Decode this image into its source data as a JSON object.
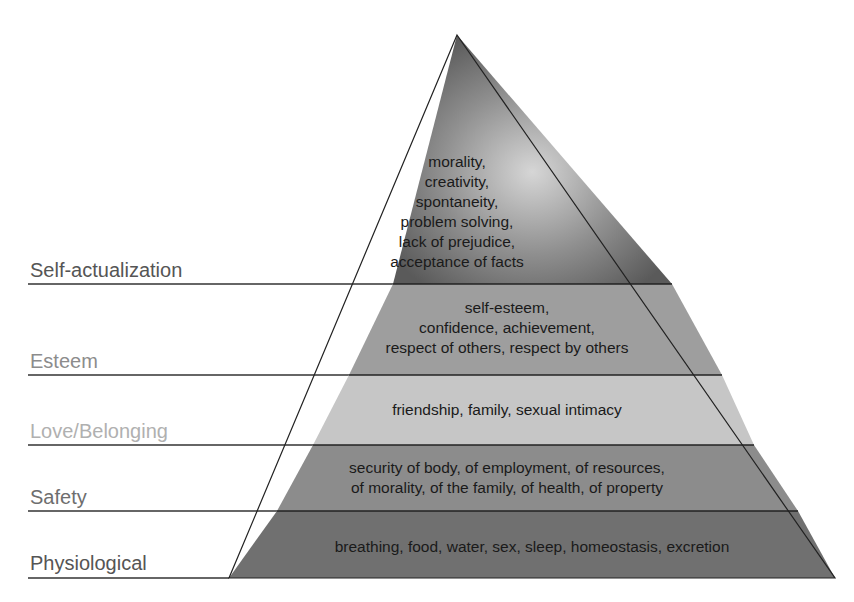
{
  "levels": [
    {
      "name": "Self-actualization",
      "label_color": "#555555",
      "fill_top": "#8a8a8a",
      "fill_bottom": "#5e5e5e",
      "lines": [
        "morality,",
        "creativity,",
        "spontaneity,",
        "problem solving,",
        "lack of prejudice,",
        "acceptance of facts"
      ]
    },
    {
      "name": "Esteem",
      "label_color": "#8c8c8c",
      "fill": "#9e9e9e",
      "lines": [
        "self-esteem,",
        "confidence, achievement,",
        "respect of others, respect by others"
      ]
    },
    {
      "name": "Love/Belonging",
      "label_color": "#b0b0b0",
      "fill": "#c4c4c4",
      "lines": [
        "friendship, family, sexual intimacy"
      ]
    },
    {
      "name": "Safety",
      "label_color": "#6e6e6e",
      "fill": "#8a8a8a",
      "lines": [
        "security of body, of employment, of resources,",
        "of morality, of the family, of health, of property"
      ]
    },
    {
      "name": "Physiological",
      "label_color": "#555555",
      "fill": "#6e6e6e",
      "lines": [
        "breathing, food, water, sex, sleep, homeostasis, excretion"
      ]
    }
  ],
  "colors": {
    "outline": "#222222",
    "label_rule": "#333333",
    "text": "#1a1a1a"
  }
}
